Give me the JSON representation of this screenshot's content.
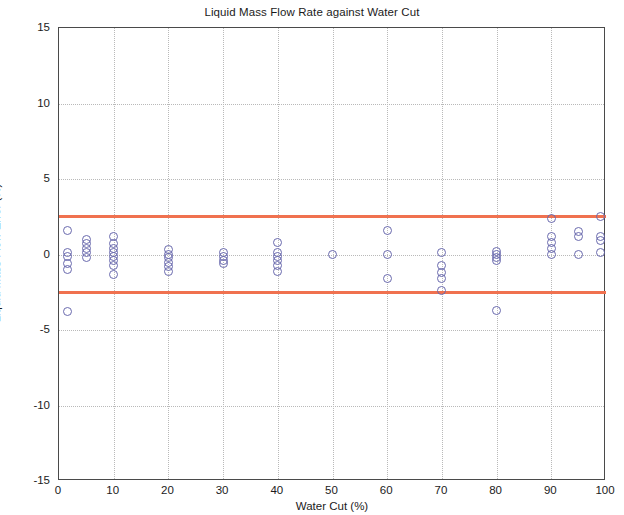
{
  "chart_data": {
    "type": "scatter",
    "title": "Liquid Mass Flow Rate against Water Cut",
    "xlabel": "Water Cut (%)",
    "ylabel": "Liquid Mass Flow Error (%)",
    "xlim": [
      0,
      100
    ],
    "ylim": [
      -15,
      15
    ],
    "xticks": [
      0,
      10,
      20,
      30,
      40,
      50,
      60,
      70,
      80,
      90,
      100
    ],
    "yticks": [
      -15,
      -10,
      -5,
      0,
      5,
      10,
      15
    ],
    "grid": true,
    "legend": "none",
    "marker_color": "#6a6aae",
    "limit_line_color": "#f0714f",
    "limit_lines": [
      2.5,
      -2.5
    ],
    "series": [
      {
        "name": "Liquid Mass Flow Error",
        "points": [
          [
            1.5,
            1.6
          ],
          [
            1.5,
            0.1
          ],
          [
            1.5,
            -0.1
          ],
          [
            1.5,
            -0.6
          ],
          [
            1.5,
            -1.0
          ],
          [
            1.5,
            -3.8
          ],
          [
            5,
            1.0
          ],
          [
            5,
            0.7
          ],
          [
            5,
            0.4
          ],
          [
            5,
            0.1
          ],
          [
            5,
            -0.2
          ],
          [
            10,
            1.2
          ],
          [
            10,
            0.7
          ],
          [
            10,
            0.4
          ],
          [
            10,
            0.1
          ],
          [
            10,
            -0.1
          ],
          [
            10,
            -0.4
          ],
          [
            10,
            -0.7
          ],
          [
            10,
            -1.3
          ],
          [
            20,
            0.3
          ],
          [
            20,
            0.0
          ],
          [
            20,
            -0.2
          ],
          [
            20,
            -0.5
          ],
          [
            20,
            -0.8
          ],
          [
            20,
            -1.1
          ],
          [
            30,
            0.1
          ],
          [
            30,
            -0.1
          ],
          [
            30,
            -0.4
          ],
          [
            30,
            -0.6
          ],
          [
            40,
            0.8
          ],
          [
            40,
            0.1
          ],
          [
            40,
            -0.1
          ],
          [
            40,
            -0.4
          ],
          [
            40,
            -0.7
          ],
          [
            40,
            -1.1
          ],
          [
            50,
            0.0
          ],
          [
            60,
            1.6
          ],
          [
            60,
            0.0
          ],
          [
            60,
            -1.6
          ],
          [
            70,
            0.1
          ],
          [
            70,
            -0.7
          ],
          [
            70,
            -1.2
          ],
          [
            70,
            -1.6
          ],
          [
            70,
            -2.4
          ],
          [
            80,
            0.2
          ],
          [
            80,
            0.0
          ],
          [
            80,
            -0.2
          ],
          [
            80,
            -0.4
          ],
          [
            80,
            -3.7
          ],
          [
            90,
            2.4
          ],
          [
            90,
            1.2
          ],
          [
            90,
            0.8
          ],
          [
            90,
            0.4
          ],
          [
            90,
            0.0
          ],
          [
            95,
            1.5
          ],
          [
            95,
            1.2
          ],
          [
            95,
            0.0
          ],
          [
            99,
            2.5
          ],
          [
            99,
            1.2
          ],
          [
            99,
            0.9
          ],
          [
            99,
            0.1
          ]
        ]
      }
    ]
  }
}
